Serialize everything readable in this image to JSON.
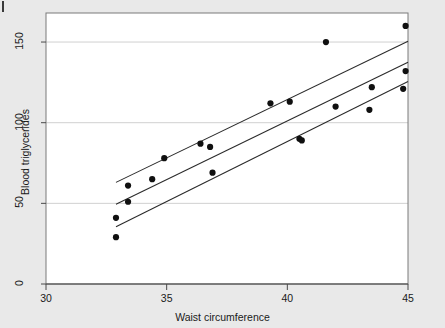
{
  "figure": {
    "background_color": "#e9e9e9",
    "plot_background_color": "#ffffff",
    "marker_color": "#101010",
    "line_color": "#2b2b2b",
    "grid_color": "#d0d0d0",
    "frame_color": "#7a7a7a"
  },
  "chart_data": {
    "type": "scatter",
    "title": "",
    "xlabel": "Waist circumference",
    "ylabel": "Blood triglycerides",
    "xlim": [
      30,
      45
    ],
    "ylim": [
      0,
      168
    ],
    "xticks": [
      30,
      35,
      40,
      45
    ],
    "xtick_labels": [
      "30",
      "35",
      "40",
      "45"
    ],
    "yticks": [
      0,
      50,
      100,
      150
    ],
    "ytick_labels": [
      "0",
      "50",
      "100",
      "150"
    ],
    "grid": "horizontal",
    "legend": "none",
    "x": [
      32.9,
      32.9,
      33.4,
      33.4,
      34.4,
      34.9,
      36.4,
      36.8,
      36.9,
      39.3,
      40.1,
      40.5,
      40.6,
      41.6,
      42.0,
      43.4,
      43.5,
      44.8,
      44.9,
      44.9
    ],
    "y": [
      29,
      41,
      51,
      61,
      65,
      78,
      87,
      85,
      69,
      112,
      113,
      90,
      89,
      150,
      110,
      108,
      122,
      121,
      132,
      160
    ],
    "points": [
      {
        "x": 32.9,
        "y": 29
      },
      {
        "x": 32.9,
        "y": 41
      },
      {
        "x": 33.4,
        "y": 51
      },
      {
        "x": 33.4,
        "y": 61
      },
      {
        "x": 34.4,
        "y": 65
      },
      {
        "x": 34.9,
        "y": 78
      },
      {
        "x": 36.4,
        "y": 87
      },
      {
        "x": 36.8,
        "y": 85
      },
      {
        "x": 36.9,
        "y": 69
      },
      {
        "x": 39.3,
        "y": 112
      },
      {
        "x": 40.1,
        "y": 113
      },
      {
        "x": 40.5,
        "y": 90
      },
      {
        "x": 40.6,
        "y": 89
      },
      {
        "x": 41.6,
        "y": 150
      },
      {
        "x": 42.0,
        "y": 110
      },
      {
        "x": 43.4,
        "y": 108
      },
      {
        "x": 43.5,
        "y": 122
      },
      {
        "x": 44.8,
        "y": 121
      },
      {
        "x": 44.9,
        "y": 132
      },
      {
        "x": 44.9,
        "y": 160
      }
    ],
    "series": [
      {
        "name": "fit-line",
        "type": "line",
        "x": [
          32.9,
          45.0
        ],
        "y": [
          49.5,
          137.5
        ]
      },
      {
        "name": "upper-confidence-band",
        "type": "line",
        "x": [
          32.9,
          45.0
        ],
        "y": [
          63.0,
          150.5
        ]
      },
      {
        "name": "lower-confidence-band",
        "type": "line",
        "x": [
          32.9,
          45.0
        ],
        "y": [
          35.5,
          125.5
        ]
      }
    ]
  }
}
